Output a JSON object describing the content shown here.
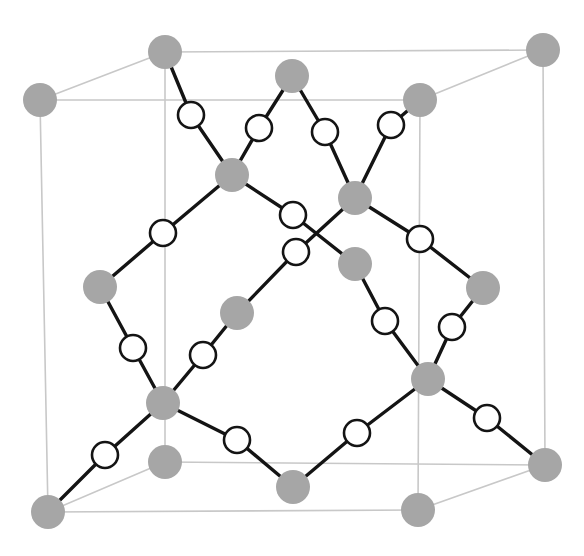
{
  "figure": {
    "background_color": "#ffffff"
  },
  "style": {
    "cube_edge_color": "#c8c8c8",
    "cube_edge_width": 1.6,
    "bond_color": "#141414",
    "bond_width": 3.4,
    "filled_atom_color": "#a6a6a6",
    "open_atom_fill": "#ffffff",
    "open_atom_stroke": "#141414",
    "open_atom_stroke_width": 2.6,
    "filled_atom_radius": 17,
    "open_atom_radius": 13
  },
  "cube": {
    "vertices": {
      "front_bottom_left": [
        48,
        512
      ],
      "front_bottom_right": [
        418,
        510
      ],
      "front_top_left": [
        40,
        100
      ],
      "front_top_right": [
        420,
        100
      ],
      "back_bottom_left": [
        165,
        462
      ],
      "back_bottom_right": [
        545,
        465
      ],
      "back_top_left": [
        165,
        52
      ],
      "back_top_right": [
        543,
        50
      ]
    },
    "edges": [
      [
        "front_bottom_left",
        "front_bottom_right"
      ],
      [
        "front_bottom_right",
        "front_top_right"
      ],
      [
        "front_top_right",
        "front_top_left"
      ],
      [
        "front_top_left",
        "front_bottom_left"
      ],
      [
        "back_bottom_left",
        "back_bottom_right"
      ],
      [
        "back_bottom_right",
        "back_top_right"
      ],
      [
        "back_top_right",
        "back_top_left"
      ],
      [
        "back_top_left",
        "back_bottom_left"
      ],
      [
        "front_bottom_left",
        "back_bottom_left"
      ],
      [
        "front_bottom_right",
        "back_bottom_right"
      ],
      [
        "front_top_left",
        "back_top_left"
      ],
      [
        "front_top_right",
        "back_top_right"
      ]
    ]
  },
  "atoms": {
    "filled": [
      {
        "id": "A1",
        "label": "corner-back-top-left",
        "x": 165,
        "y": 52,
        "site": "corner"
      },
      {
        "id": "A2",
        "label": "corner-back-top-right",
        "x": 543,
        "y": 50,
        "site": "corner"
      },
      {
        "id": "A3",
        "label": "corner-front-top-left",
        "x": 40,
        "y": 100,
        "site": "corner"
      },
      {
        "id": "A4",
        "label": "corner-front-top-right",
        "x": 420,
        "y": 100,
        "site": "corner"
      },
      {
        "id": "A5",
        "label": "corner-front-bottom-left",
        "x": 48,
        "y": 512,
        "site": "corner"
      },
      {
        "id": "A6",
        "label": "corner-front-bottom-right",
        "x": 418,
        "y": 510,
        "site": "corner"
      },
      {
        "id": "A7",
        "label": "corner-back-bottom-left",
        "x": 165,
        "y": 462,
        "site": "corner"
      },
      {
        "id": "A8",
        "label": "corner-back-bottom-right",
        "x": 545,
        "y": 465,
        "site": "corner"
      },
      {
        "id": "A9",
        "label": "face-top-center",
        "x": 292,
        "y": 76,
        "site": "face-center"
      },
      {
        "id": "A10",
        "label": "face-bottom-center",
        "x": 293,
        "y": 487,
        "site": "face-center"
      },
      {
        "id": "A11",
        "label": "face-left-center",
        "x": 100,
        "y": 287,
        "site": "face-center"
      },
      {
        "id": "A12",
        "label": "face-right-center",
        "x": 483,
        "y": 288,
        "site": "face-center"
      },
      {
        "id": "A13",
        "label": "face-front-center",
        "x": 232,
        "y": 175,
        "site": "face-center"
      },
      {
        "id": "A14",
        "label": "face-back-center",
        "x": 355,
        "y": 198,
        "site": "face-center"
      },
      {
        "id": "A15",
        "label": "interior-lower-left",
        "x": 237,
        "y": 313,
        "site": "interior"
      },
      {
        "id": "A16",
        "label": "interior-upper-right",
        "x": 355,
        "y": 264,
        "site": "interior"
      },
      {
        "id": "A17",
        "label": "interior-lower-left-vertex",
        "x": 163,
        "y": 403,
        "site": "interior"
      },
      {
        "id": "A18",
        "label": "interior-lower-right-vertex",
        "x": 428,
        "y": 379,
        "site": "interior"
      }
    ],
    "open": [
      {
        "id": "B1",
        "label": "tetra-upper-left-1",
        "x": 191,
        "y": 115,
        "site": "tetrahedral"
      },
      {
        "id": "B2",
        "label": "tetra-upper-left-2",
        "x": 259,
        "y": 128,
        "site": "tetrahedral"
      },
      {
        "id": "B3",
        "label": "tetra-upper-right-1",
        "x": 325,
        "y": 132,
        "site": "tetrahedral"
      },
      {
        "id": "B4",
        "label": "tetra-upper-right-2",
        "x": 391,
        "y": 125,
        "site": "tetrahedral"
      },
      {
        "id": "B5",
        "label": "tetra-mid-upper-center",
        "x": 293,
        "y": 215,
        "site": "tetrahedral"
      },
      {
        "id": "B6",
        "label": "tetra-mid-lower-center",
        "x": 296,
        "y": 252,
        "site": "tetrahedral"
      },
      {
        "id": "B7",
        "label": "tetra-mid-left",
        "x": 163,
        "y": 233,
        "site": "tetrahedral"
      },
      {
        "id": "B8",
        "label": "tetra-mid-right",
        "x": 420,
        "y": 239,
        "site": "tetrahedral"
      },
      {
        "id": "B9",
        "label": "tetra-lower-left-1",
        "x": 133,
        "y": 348,
        "site": "tetrahedral"
      },
      {
        "id": "B10",
        "label": "tetra-lower-left-2",
        "x": 203,
        "y": 355,
        "site": "tetrahedral"
      },
      {
        "id": "B11",
        "label": "tetra-lower-right-1",
        "x": 385,
        "y": 321,
        "site": "tetrahedral"
      },
      {
        "id": "B12",
        "label": "tetra-lower-right-2",
        "x": 452,
        "y": 327,
        "site": "tetrahedral"
      },
      {
        "id": "B13",
        "label": "tetra-bottom-left-1",
        "x": 105,
        "y": 455,
        "site": "tetrahedral"
      },
      {
        "id": "B14",
        "label": "tetra-bottom-left-2",
        "x": 237,
        "y": 440,
        "site": "tetrahedral"
      },
      {
        "id": "B15",
        "label": "tetra-bottom-right-1",
        "x": 357,
        "y": 433,
        "site": "tetrahedral"
      },
      {
        "id": "B16",
        "label": "tetra-bottom-right-2",
        "x": 487,
        "y": 418,
        "site": "tetrahedral"
      }
    ]
  },
  "bonds": [
    [
      "A1",
      "B1"
    ],
    [
      "B1",
      "A13"
    ],
    [
      "A9",
      "B2"
    ],
    [
      "B2",
      "A13"
    ],
    [
      "A9",
      "B3"
    ],
    [
      "B3",
      "A14"
    ],
    [
      "A4",
      "B4"
    ],
    [
      "B4",
      "A14"
    ],
    [
      "A13",
      "B5"
    ],
    [
      "B5",
      "A16"
    ],
    [
      "A14",
      "B6"
    ],
    [
      "B6",
      "A15"
    ],
    [
      "A13",
      "B7"
    ],
    [
      "B7",
      "A11"
    ],
    [
      "A14",
      "B8"
    ],
    [
      "B8",
      "A12"
    ],
    [
      "A11",
      "B9"
    ],
    [
      "B9",
      "A17"
    ],
    [
      "A15",
      "B10"
    ],
    [
      "B10",
      "A17"
    ],
    [
      "A16",
      "B11"
    ],
    [
      "B11",
      "A18"
    ],
    [
      "A12",
      "B12"
    ],
    [
      "B12",
      "A18"
    ],
    [
      "A17",
      "B13"
    ],
    [
      "B13",
      "A5"
    ],
    [
      "A17",
      "B14"
    ],
    [
      "B14",
      "A10"
    ],
    [
      "A18",
      "B15"
    ],
    [
      "B15",
      "A10"
    ],
    [
      "A18",
      "B16"
    ],
    [
      "B16",
      "A8"
    ]
  ]
}
